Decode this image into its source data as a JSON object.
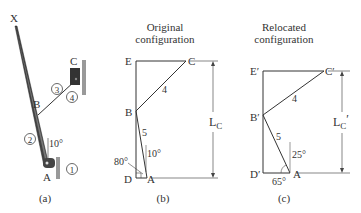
{
  "panel_a": {
    "caption": "(a)",
    "points": {
      "X": "X",
      "B": "B",
      "C": "C",
      "A": "A"
    },
    "links": [
      "1",
      "2",
      "3",
      "4"
    ],
    "angle": "10°"
  },
  "panel_b": {
    "caption": "(b)",
    "title_line1": "Original",
    "title_line2": "configuration",
    "points": {
      "E": "E",
      "C": "C",
      "B": "B",
      "D": "D",
      "A": "A"
    },
    "link_labels": {
      "bc": "4",
      "ab": "5"
    },
    "angles": {
      "vertical": "10°",
      "base": "80°"
    },
    "dimension": {
      "main": "L",
      "sub": "C"
    }
  },
  "panel_c": {
    "caption": "(c)",
    "title_line1": "Relocated",
    "title_line2": "configuration",
    "points": {
      "E": "E′",
      "C": "C′",
      "B": "B′",
      "D": "D′",
      "A": "A"
    },
    "link_labels": {
      "bc": "4",
      "ab": "5"
    },
    "angles": {
      "vertical": "25°",
      "base": "65°"
    },
    "dimension": {
      "main": "L",
      "sub": "C",
      "prime": "′"
    }
  }
}
